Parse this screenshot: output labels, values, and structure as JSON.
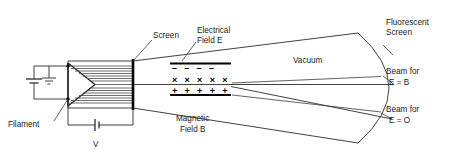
{
  "figure": {
    "background_color": "#ffffff",
    "line_color": "#1a1a1a",
    "text_color": "#1a1a1a",
    "width": 463,
    "height": 163
  },
  "labels": {
    "screen": "Screen",
    "electrical_field_line1": "Electrical",
    "electrical_field_line2": "Field E",
    "fluorescent_line1": "Fluorescent",
    "fluorescent_line2": "Screen",
    "vacuum": "Vacuum",
    "beam_b_line1": "Beam for",
    "beam_b_line2": "E = B",
    "beam_o_line1": "Beam for",
    "beam_o_line2": "E = O",
    "magnetic_line1": "Magnetic",
    "magnetic_line2": "Field B",
    "filament": "Filament",
    "voltage": "V"
  },
  "field_markers": {
    "negative_plate_signs": "–  –  –  –",
    "magnetic_into_page": "× × × × ×",
    "positive_plate_signs": "+ + + + +"
  },
  "components": {
    "filament_battery": "battery-cell-symbol",
    "accelerating_battery": "battery-cell-symbol",
    "ground": "ground-symbol",
    "electron_gun": "wedge-cathode",
    "anode_screen": "vertical-bar",
    "fluorescent_screen": "curved-arc",
    "deflecting_plates": "parallel-plate-pair"
  }
}
